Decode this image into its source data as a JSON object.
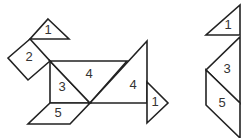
{
  "diagram": {
    "type": "tangram",
    "figures": [
      {
        "name": "left-figure",
        "pieces": [
          {
            "id": "tri-1-top",
            "label": "1",
            "points": "48,19 69,39 30,39",
            "label_pos": [
              48,
              31
            ]
          },
          {
            "id": "square-2",
            "label": "2",
            "points": "30,39 50,61 28,80 8,58",
            "label_pos": [
              29,
              58
            ]
          },
          {
            "id": "tri-3",
            "label": "3",
            "points": "50,61 90,103 50,103",
            "label_pos": [
              62,
              88
            ]
          },
          {
            "id": "tri-4-mid",
            "label": "4",
            "points": "50,61 127,61 90,103",
            "label_pos": [
              89,
              75
            ]
          },
          {
            "id": "tri-4-large",
            "label": "4",
            "points": "147,41 147,103 90,103",
            "label_pos": [
              133,
              86
            ]
          },
          {
            "id": "para-5",
            "label": "5",
            "points": "50,103 90,103 70,124 28,124",
            "label_pos": [
              58,
              114
            ]
          },
          {
            "id": "tri-1-tail",
            "label": "1",
            "points": "147,82 168,103 147,123",
            "label_pos": [
              155,
              103
            ]
          }
        ]
      },
      {
        "name": "right-figure",
        "pieces": [
          {
            "id": "tri-1",
            "label": "1",
            "points": "240,5 240,35 206,35",
            "label_pos": [
              228,
              26
            ]
          },
          {
            "id": "tri-3",
            "label": "3",
            "points": "240,37 240,103 206,70",
            "label_pos": [
              227,
              70
            ]
          },
          {
            "id": "para-5",
            "label": "5",
            "points": "206,70 240,103 240,138 206,105",
            "label_pos": [
              222,
              104
            ]
          }
        ]
      }
    ]
  }
}
